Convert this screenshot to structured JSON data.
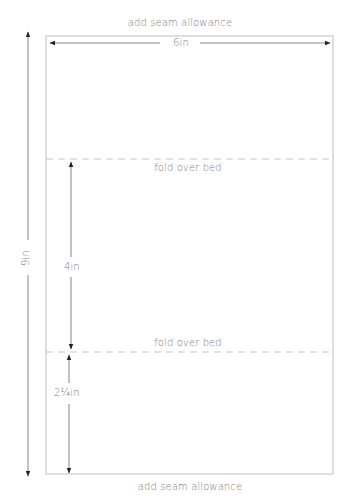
{
  "diagram": {
    "type": "sewing-pattern",
    "top_note": "add seam allowance",
    "bottom_note": "add seam allowance",
    "width_label": "6in",
    "height_label": "9in",
    "fold_lines": [
      {
        "label": "fold over bed"
      },
      {
        "label": "fold over bed"
      }
    ],
    "section_labels": {
      "middle": "4in",
      "bottom": "2¼in"
    },
    "colors": {
      "outline": "#bdbdbd",
      "arrow": "#333333",
      "text": "#7a7a7a",
      "fold": "#c8c8c8"
    }
  }
}
